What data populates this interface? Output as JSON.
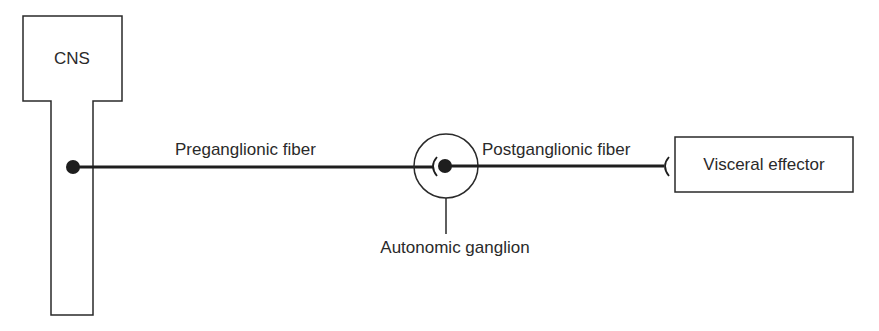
{
  "diagram": {
    "type": "anatomical-schematic",
    "title": "",
    "nodes": {
      "cns": {
        "label": "CNS"
      },
      "ganglion": {
        "label": "Autonomic ganglion"
      },
      "effector": {
        "label": "Visceral effector"
      }
    },
    "edges": {
      "preganglionic": {
        "label": "Preganglionic fiber",
        "from": "cns",
        "to": "ganglion"
      },
      "postganglionic": {
        "label": "Postganglionic fiber",
        "from": "ganglion",
        "to": "effector"
      }
    },
    "colors": {
      "stroke": "#2a2a2a",
      "fill": "#ffffff",
      "text": "#2a2a2a"
    }
  }
}
